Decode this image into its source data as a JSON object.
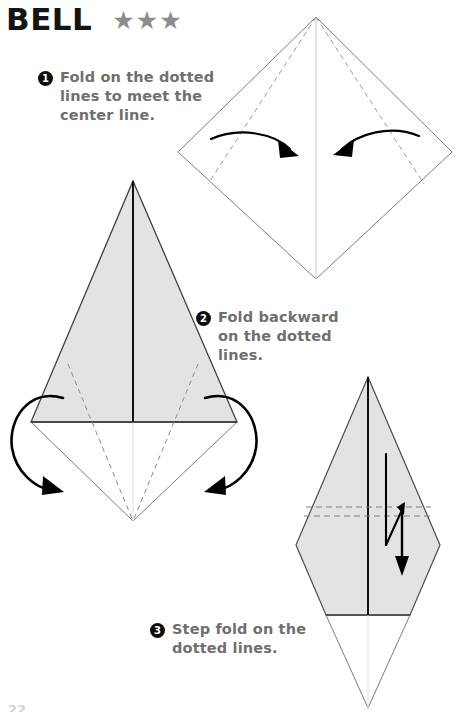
{
  "header": {
    "title": "BELL",
    "difficulty_stars": 3,
    "star_glyph": "★",
    "star_color": "#8d8d8d",
    "title_color": "#141414"
  },
  "steps": [
    {
      "number": "1",
      "text": "Fold on the dotted lines to meet the center line."
    },
    {
      "number": "2",
      "text": "Fold backward on the dotted lines."
    },
    {
      "number": "3",
      "text": "Step fold on the dotted lines."
    }
  ],
  "colors": {
    "paper_front": "#e3e3e3",
    "paper_back": "#ffffff",
    "outline": "#555555",
    "crease_solid": "#111111",
    "crease_dashed": "#8a8a8a",
    "arrow": "#000000",
    "text_gray": "#6f6f6f",
    "step_badge": "#0d0d0d"
  },
  "diagrams": [
    {
      "id": "diagram-1",
      "caption_step": "1",
      "shape": "square rotated 45 degrees (diamond), white side up",
      "creases": [
        "vertical center line",
        "two dashed lines from top vertex to lower side edges"
      ],
      "arrows": [
        "curved arrow pointing right toward center",
        "curved arrow pointing left toward center"
      ]
    },
    {
      "id": "diagram-2",
      "caption_step": "2",
      "shape": "kite: gray triangle on top over white lower diamond half",
      "creases": [
        "vertical center line",
        "horizontal shoulder line",
        "two dashed lines fanning to bottom point"
      ],
      "arrows": [
        "looping fold-backward arrow on the left",
        "looping fold-backward arrow on the right"
      ]
    },
    {
      "id": "diagram-3",
      "caption_step": "3",
      "shape": "narrow gray kite with white bottom triangle",
      "creases": [
        "vertical center line",
        "two horizontal dashed lines",
        "horizontal shoulder line"
      ],
      "arrows": [
        "step fold zigzag arrow pointing down"
      ]
    }
  ],
  "page_number": "22"
}
